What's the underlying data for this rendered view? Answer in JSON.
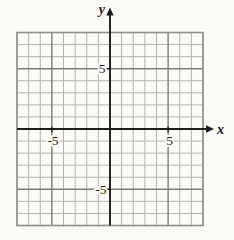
{
  "figure": {
    "axis_labels": {
      "x": "x",
      "y": "y"
    },
    "tick_labels": {
      "x_pos": "5",
      "x_neg": "-5",
      "y_pos": "5",
      "y_neg": "-5"
    }
  },
  "chart_data": {
    "type": "line",
    "series": [],
    "title": "",
    "xlabel": "x",
    "ylabel": "y",
    "xlim": [
      -8,
      8
    ],
    "ylim": [
      -8,
      8
    ],
    "labeled_x_ticks": [
      -5,
      5
    ],
    "labeled_y_ticks": [
      -5,
      5
    ],
    "minor_grid_step": 1,
    "major_grid_step": 5,
    "grid": true,
    "legend_position": "none"
  },
  "colors": {
    "paper": "#fcfbf6",
    "grid_minor": "#b3b1ae",
    "grid_major": "#7d7c79",
    "grid_border": "#8f8e8a",
    "axis": "#1c1c1c"
  }
}
